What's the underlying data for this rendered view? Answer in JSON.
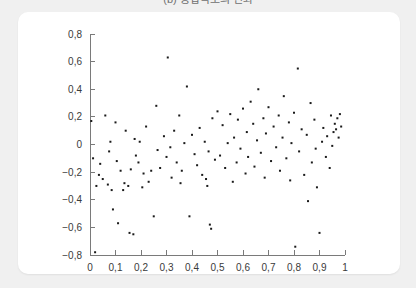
{
  "figure": {
    "caption": "(b) 응답속도의 변화",
    "card_background": "#ffffff",
    "page_background": "#f0f0f0"
  },
  "chart_data": {
    "type": "scatter",
    "title": "(b) 응답속도의 변화",
    "xlabel": "",
    "ylabel": "",
    "xlim": [
      0,
      1
    ],
    "ylim": [
      -0.8,
      0.8
    ],
    "grid": false,
    "legend": null,
    "marker_color": "#1a1a1a",
    "marker_size": 2,
    "decimal_separator": ",",
    "xticks": [
      0,
      0.1,
      0.2,
      0.3,
      0.4,
      0.5,
      0.6,
      0.7,
      0.8,
      0.9,
      1
    ],
    "xtick_labels": [
      "0",
      "0,1",
      "0,2",
      "0,3",
      "0,4",
      "0,5",
      "0,6",
      "0,7",
      "0,8",
      "0,9",
      "1"
    ],
    "yticks": [
      0.8,
      0.6,
      0.4,
      0.2,
      0,
      -0.2,
      -0.4,
      -0.6,
      -0.8
    ],
    "ytick_labels": [
      "0,8",
      "0,6",
      "0,4",
      "0,2",
      "0",
      "−0,2",
      "−0,4",
      "−0,6",
      "−0,8"
    ],
    "points": [
      [
        0.005,
        0.17
      ],
      [
        0.012,
        -0.1
      ],
      [
        0.02,
        -0.78
      ],
      [
        0.025,
        -0.3
      ],
      [
        0.035,
        -0.22
      ],
      [
        0.04,
        -0.14
      ],
      [
        0.05,
        -0.25
      ],
      [
        0.06,
        0.21
      ],
      [
        0.07,
        -0.29
      ],
      [
        0.075,
        -0.05
      ],
      [
        0.08,
        0.02
      ],
      [
        0.085,
        -0.33
      ],
      [
        0.09,
        -0.47
      ],
      [
        0.1,
        0.16
      ],
      [
        0.105,
        -0.12
      ],
      [
        0.11,
        -0.57
      ],
      [
        0.12,
        -0.19
      ],
      [
        0.13,
        -0.33
      ],
      [
        0.135,
        -0.28
      ],
      [
        0.14,
        0.1
      ],
      [
        0.15,
        -0.3
      ],
      [
        0.155,
        -0.64
      ],
      [
        0.16,
        -0.18
      ],
      [
        0.17,
        -0.65
      ],
      [
        0.175,
        0.04
      ],
      [
        0.18,
        -0.08
      ],
      [
        0.19,
        -0.13
      ],
      [
        0.195,
        0.02
      ],
      [
        0.205,
        -0.31
      ],
      [
        0.21,
        -0.21
      ],
      [
        0.22,
        0.13
      ],
      [
        0.23,
        -0.27
      ],
      [
        0.24,
        -0.19
      ],
      [
        0.25,
        -0.52
      ],
      [
        0.26,
        0.28
      ],
      [
        0.265,
        -0.04
      ],
      [
        0.275,
        -0.17
      ],
      [
        0.29,
        0.06
      ],
      [
        0.3,
        -0.09
      ],
      [
        0.305,
        0.63
      ],
      [
        0.315,
        -0.02
      ],
      [
        0.32,
        -0.24
      ],
      [
        0.33,
        0.1
      ],
      [
        0.34,
        -0.13
      ],
      [
        0.35,
        0.21
      ],
      [
        0.355,
        -0.28
      ],
      [
        0.36,
        -0.19
      ],
      [
        0.37,
        0.01
      ],
      [
        0.38,
        0.42
      ],
      [
        0.39,
        -0.52
      ],
      [
        0.4,
        0.07
      ],
      [
        0.41,
        -0.07
      ],
      [
        0.42,
        -0.15
      ],
      [
        0.43,
        0.12
      ],
      [
        0.44,
        -0.22
      ],
      [
        0.45,
        0.02
      ],
      [
        0.455,
        -0.25
      ],
      [
        0.46,
        -0.3
      ],
      [
        0.465,
        -0.05
      ],
      [
        0.47,
        -0.58
      ],
      [
        0.475,
        -0.61
      ],
      [
        0.48,
        0.19
      ],
      [
        0.49,
        -0.11
      ],
      [
        0.5,
        0.24
      ],
      [
        0.51,
        -0.08
      ],
      [
        0.52,
        0.14
      ],
      [
        0.53,
        -0.17
      ],
      [
        0.54,
        0.01
      ],
      [
        0.55,
        0.22
      ],
      [
        0.56,
        -0.27
      ],
      [
        0.565,
        0.05
      ],
      [
        0.575,
        -0.13
      ],
      [
        0.58,
        0.18
      ],
      [
        0.59,
        -0.03
      ],
      [
        0.6,
        0.26
      ],
      [
        0.61,
        -0.21
      ],
      [
        0.615,
        0.09
      ],
      [
        0.62,
        -0.09
      ],
      [
        0.63,
        0.31
      ],
      [
        0.64,
        0.15
      ],
      [
        0.645,
        -0.16
      ],
      [
        0.655,
        0.03
      ],
      [
        0.66,
        0.4
      ],
      [
        0.67,
        -0.06
      ],
      [
        0.68,
        0.19
      ],
      [
        0.685,
        -0.24
      ],
      [
        0.69,
        0.08
      ],
      [
        0.7,
        0.27
      ],
      [
        0.71,
        -0.12
      ],
      [
        0.72,
        0.13
      ],
      [
        0.73,
        -0.02
      ],
      [
        0.74,
        0.21
      ],
      [
        0.745,
        -0.19
      ],
      [
        0.755,
        0.05
      ],
      [
        0.76,
        0.35
      ],
      [
        0.77,
        -0.1
      ],
      [
        0.78,
        0.16
      ],
      [
        0.785,
        -0.26
      ],
      [
        0.79,
        0.01
      ],
      [
        0.8,
        0.23
      ],
      [
        0.805,
        -0.74
      ],
      [
        0.815,
        0.55
      ],
      [
        0.82,
        -0.05
      ],
      [
        0.83,
        0.11
      ],
      [
        0.84,
        -0.22
      ],
      [
        0.85,
        0.07
      ],
      [
        0.855,
        -0.41
      ],
      [
        0.865,
        0.3
      ],
      [
        0.87,
        -0.13
      ],
      [
        0.88,
        0.18
      ],
      [
        0.885,
        -0.03
      ],
      [
        0.89,
        -0.31
      ],
      [
        0.9,
        -0.64
      ],
      [
        0.91,
        0.02
      ],
      [
        0.915,
        0.12
      ],
      [
        0.925,
        -0.09
      ],
      [
        0.93,
        0.06
      ],
      [
        0.94,
        -0.17
      ],
      [
        0.945,
        0.21
      ],
      [
        0.95,
        -0.01
      ],
      [
        0.955,
        0.09
      ],
      [
        0.96,
        0.15
      ],
      [
        0.965,
        0.11
      ],
      [
        0.97,
        0.19
      ],
      [
        0.975,
        0.05
      ],
      [
        0.98,
        0.22
      ],
      [
        0.985,
        0.13
      ]
    ]
  }
}
